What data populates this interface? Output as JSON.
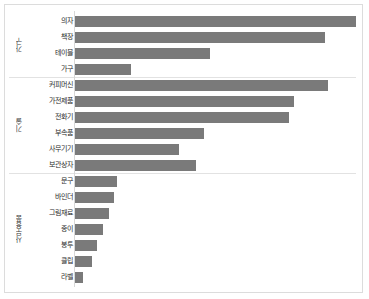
{
  "chart_data": {
    "type": "bar",
    "orientation": "horizontal",
    "title": "",
    "subtitle": "",
    "xlabel": "",
    "ylabel": "",
    "grid": false,
    "legend": "none",
    "bar_color": "#7a7a7a",
    "panel_border_color": "#dcdcdc",
    "background": "#ffffff",
    "xlim": [
      0,
      100
    ],
    "value_unit": "relative",
    "groups": [
      {
        "name": "가구",
        "categories": [
          "의자",
          "책장",
          "테이블",
          "가구"
        ],
        "values": [
          100,
          89,
          48,
          20
        ]
      },
      {
        "name": "기술",
        "categories": [
          "커피머신",
          "가전제품",
          "전화기",
          "부속품",
          "사무기기",
          "보관상자"
        ],
        "values": [
          90,
          78,
          76,
          46,
          37,
          43
        ]
      },
      {
        "name": "사무용품",
        "categories": [
          "문구",
          "바인더",
          "그림재료",
          "종이",
          "봉투",
          "클립",
          "라벨"
        ],
        "values": [
          15,
          14,
          12,
          10,
          8,
          6,
          3
        ]
      }
    ],
    "categories": [
      "의자",
      "책장",
      "테이블",
      "가구",
      "커피머신",
      "가전제품",
      "전화기",
      "부속품",
      "사무기기",
      "보관상자",
      "문구",
      "바인더",
      "그림재료",
      "종이",
      "봉투",
      "클립",
      "라벨"
    ],
    "values": [
      100,
      89,
      48,
      20,
      90,
      78,
      76,
      46,
      37,
      43,
      15,
      14,
      12,
      10,
      8,
      6,
      3
    ]
  }
}
